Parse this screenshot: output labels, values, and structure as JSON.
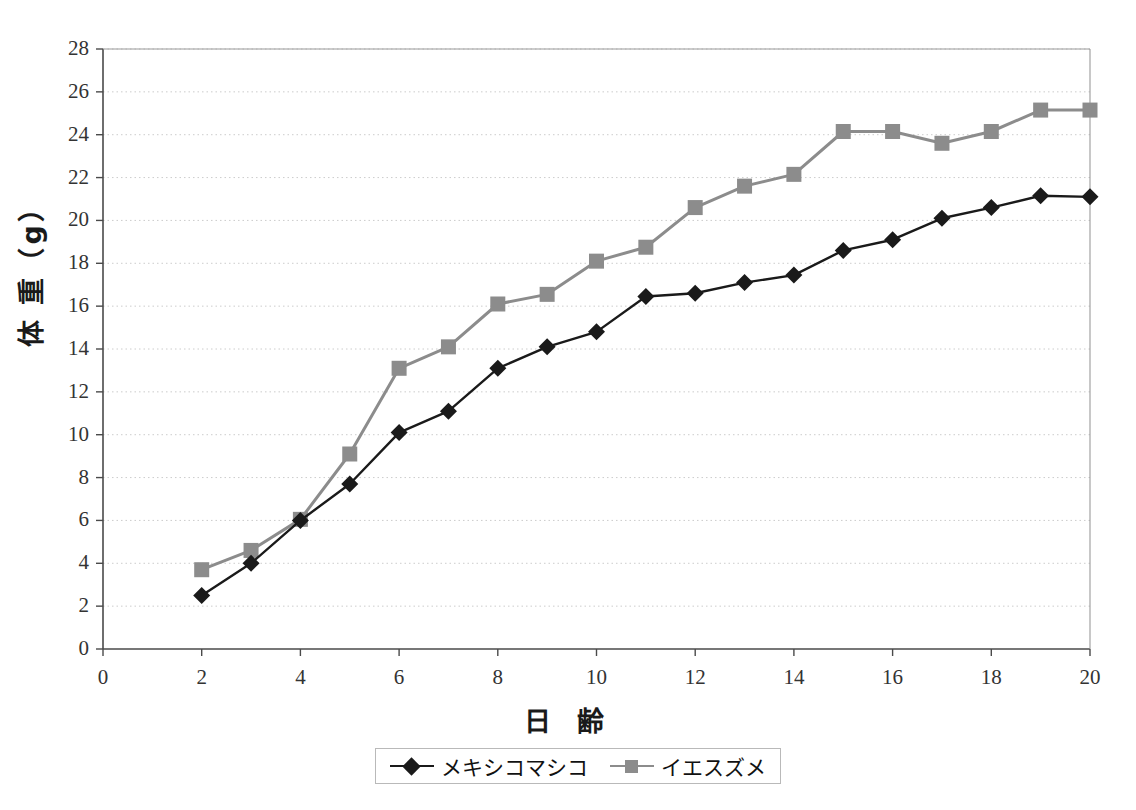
{
  "chart_data": {
    "type": "line",
    "title": "",
    "subtitle": "",
    "xlabel": "日 齢",
    "ylabel": "体 重（g）",
    "xlim": [
      0,
      20
    ],
    "ylim": [
      0,
      28
    ],
    "xticks": [
      0,
      2,
      4,
      6,
      8,
      10,
      12,
      14,
      16,
      18,
      20
    ],
    "yticks": [
      0,
      2,
      4,
      6,
      8,
      10,
      12,
      14,
      16,
      18,
      20,
      22,
      24,
      26,
      28
    ],
    "grid": "horizontal-dotted",
    "legend_position": "bottom-center",
    "x": [
      2,
      3,
      4,
      5,
      6,
      7,
      8,
      9,
      10,
      11,
      12,
      13,
      14,
      15,
      16,
      17,
      18,
      19,
      20
    ],
    "series": [
      {
        "name": "メキシコマシコ",
        "color": "#1a1a1a",
        "marker": "diamond",
        "values": [
          2.5,
          4.0,
          6.0,
          7.7,
          10.1,
          11.1,
          13.1,
          14.1,
          14.8,
          16.45,
          16.6,
          17.1,
          17.45,
          18.6,
          19.1,
          20.1,
          20.6,
          21.15,
          21.1
        ]
      },
      {
        "name": "イエスズメ",
        "color": "#8c8c8c",
        "marker": "square",
        "values": [
          3.7,
          4.6,
          6.05,
          9.1,
          13.1,
          14.1,
          16.1,
          16.55,
          18.1,
          18.75,
          20.6,
          21.6,
          22.15,
          24.15,
          24.15,
          23.6,
          24.15,
          25.15,
          25.15
        ]
      }
    ]
  },
  "axis": {
    "y_tick_labels": [
      "0",
      "2",
      "4",
      "6",
      "8",
      "10",
      "12",
      "14",
      "16",
      "18",
      "20",
      "22",
      "24",
      "26",
      "28"
    ],
    "x_tick_labels": [
      "0",
      "2",
      "4",
      "6",
      "8",
      "10",
      "12",
      "14",
      "16",
      "18",
      "20"
    ]
  },
  "legend": {
    "entries": [
      {
        "label": "メキシコマシコ"
      },
      {
        "label": "イエスズメ"
      }
    ]
  },
  "colors": {
    "series_a": "#1a1a1a",
    "series_b": "#8c8c8c",
    "axis": "#4a4a4a",
    "grid": "#cccccc",
    "background": "#ffffff"
  }
}
